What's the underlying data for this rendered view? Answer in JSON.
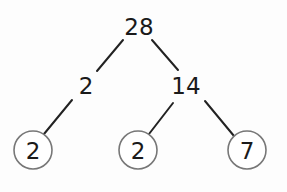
{
  "diagram": {
    "type": "factor-tree",
    "root": {
      "value": "28",
      "x": 139,
      "y": 27
    },
    "level2": [
      {
        "value": "2",
        "x": 86,
        "y": 86,
        "prime": false
      },
      {
        "value": "14",
        "x": 186,
        "y": 86,
        "prime": false
      }
    ],
    "leaves": [
      {
        "value": "2",
        "x": 33,
        "y": 150,
        "circled": true
      },
      {
        "value": "2",
        "x": 138,
        "y": 150,
        "circled": true
      },
      {
        "value": "7",
        "x": 247,
        "y": 150,
        "circled": true
      }
    ],
    "edges": [
      {
        "from": "28",
        "to": "2"
      },
      {
        "from": "28",
        "to": "14"
      },
      {
        "from": "2",
        "to": "2 (circled)"
      },
      {
        "from": "14",
        "to": "2 (circled)"
      },
      {
        "from": "14",
        "to": "7 (circled)"
      }
    ],
    "colors": {
      "line": "#222222",
      "circle": "#777777",
      "text": "#1a1a1a"
    }
  }
}
